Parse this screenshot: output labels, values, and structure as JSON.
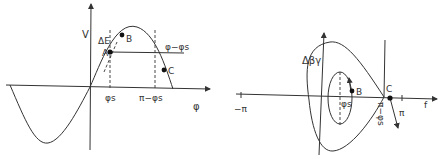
{
  "left_diagram": {
    "y_axis_label": "V",
    "x_axis_label": "φ",
    "energy_label": "ΔE",
    "phi_s_label": "φs",
    "pi_minus_phi_s_label": "π−φs",
    "line_label": "φ−φs",
    "points": [
      "A",
      "B",
      "C"
    ]
  },
  "right_diagram": {
    "y_axis_label": "Δβγ",
    "x_axis_label": "f",
    "neg_pi_label": "−π",
    "pi_label": "π",
    "phi_s_label": "φs",
    "pi_minus_phi_s_label": "π−φs",
    "points": [
      "B",
      "C"
    ]
  }
}
